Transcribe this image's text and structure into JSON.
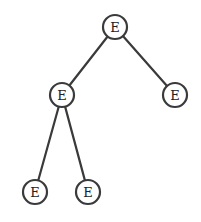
{
  "diagram": {
    "type": "tree",
    "node_radius": 12,
    "stroke_color": "#3a3a3a",
    "background": "#ffffff",
    "nodes": [
      {
        "id": "n0",
        "label": "E",
        "x": 115,
        "y": 27
      },
      {
        "id": "n1",
        "label": "E",
        "x": 62,
        "y": 95
      },
      {
        "id": "n2",
        "label": "E",
        "x": 175,
        "y": 95
      },
      {
        "id": "n3",
        "label": "E",
        "x": 35,
        "y": 192
      },
      {
        "id": "n4",
        "label": "E",
        "x": 88,
        "y": 192
      }
    ],
    "edges": [
      {
        "from": "n0",
        "to": "n1"
      },
      {
        "from": "n0",
        "to": "n2"
      },
      {
        "from": "n1",
        "to": "n3"
      },
      {
        "from": "n1",
        "to": "n4"
      }
    ]
  }
}
